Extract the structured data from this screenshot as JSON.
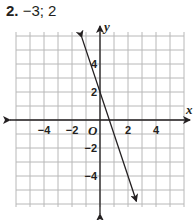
{
  "problem": {
    "number": "2.",
    "answer": "−3; 2"
  },
  "chart_data": {
    "type": "line",
    "title": "",
    "xlabel": "x",
    "ylabel": "y",
    "origin_label": "O",
    "xlim": [
      -6,
      6
    ],
    "ylim": [
      -6,
      6
    ],
    "grid": true,
    "x_ticks": [
      "−4",
      "−2",
      "2",
      "4"
    ],
    "y_ticks": [
      "4",
      "2",
      "−2",
      "−4"
    ],
    "series": [
      {
        "name": "y = -3x + 2",
        "slope": -3,
        "y_intercept": 2,
        "x": [
          -1.3,
          2.6
        ],
        "y": [
          5.9,
          -5.8
        ]
      }
    ]
  }
}
